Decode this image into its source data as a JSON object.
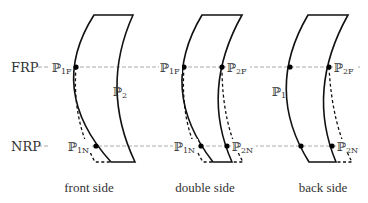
{
  "reference_lines": {
    "far": {
      "label": "FRP"
    },
    "near": {
      "label": "NRP"
    }
  },
  "panels": [
    {
      "caption": "front side",
      "labels": {
        "p1f": {
          "base": "ℙ",
          "sub": "1F"
        },
        "p1n": {
          "base": "ℙ",
          "sub": "1N"
        },
        "surface": {
          "base": "ℙ",
          "sub": "2"
        }
      }
    },
    {
      "caption": "double side",
      "labels": {
        "p1f": {
          "base": "ℙ",
          "sub": "1F"
        },
        "p2f": {
          "base": "ℙ",
          "sub": "2F"
        },
        "p1n": {
          "base": "ℙ",
          "sub": "1N"
        },
        "p2n": {
          "base": "ℙ",
          "sub": "2N"
        }
      }
    },
    {
      "caption": "back side",
      "labels": {
        "surface": {
          "base": "ℙ",
          "sub": "1"
        },
        "p2f": {
          "base": "ℙ",
          "sub": "2F"
        },
        "p2n": {
          "base": "ℙ",
          "sub": "2N"
        }
      }
    }
  ]
}
